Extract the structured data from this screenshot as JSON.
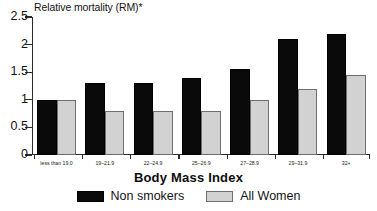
{
  "chart_data": {
    "type": "bar",
    "title": "",
    "ylabel": "Relative mortality (RM)*",
    "xlabel": "Body Mass Index",
    "ylim": [
      0,
      2.5
    ],
    "yticks": [
      "0",
      "0.5",
      "1",
      "1.5",
      "2",
      "2.5"
    ],
    "ytick_values": [
      0,
      0.5,
      1,
      1.5,
      2,
      2.5
    ],
    "grid": false,
    "legend_position": "bottom",
    "categories": [
      "less than 19.0",
      "19–21.9",
      "22–24.9",
      "25–26.9",
      "27–28.9",
      "29–31.9",
      "32+"
    ],
    "series": [
      {
        "name": "Non smokers",
        "color": "#0a0a0a",
        "values": [
          1.0,
          1.3,
          1.3,
          1.4,
          1.55,
          2.1,
          2.2
        ]
      },
      {
        "name": "All Women",
        "color": "#d2d2d2",
        "values": [
          1.0,
          0.8,
          0.8,
          0.8,
          1.0,
          1.2,
          1.45
        ]
      }
    ]
  }
}
